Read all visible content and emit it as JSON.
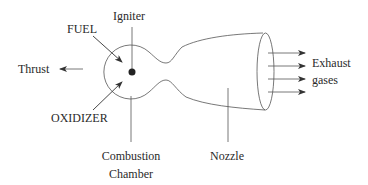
{
  "diagram": {
    "labels": {
      "igniter": "Igniter",
      "fuel": "FUEL",
      "thrust": "Thrust",
      "oxidizer": "OXIDIZER",
      "combustion_line1": "Combustion",
      "combustion_line2": "Chamber",
      "nozzle": "Nozzle",
      "exhaust_line1": "Exhaust",
      "exhaust_line2": "gases"
    },
    "colors": {
      "line": "#555555",
      "text": "#2a2a2a",
      "background": "#ffffff"
    },
    "exhaust_arrow_count": 4
  }
}
